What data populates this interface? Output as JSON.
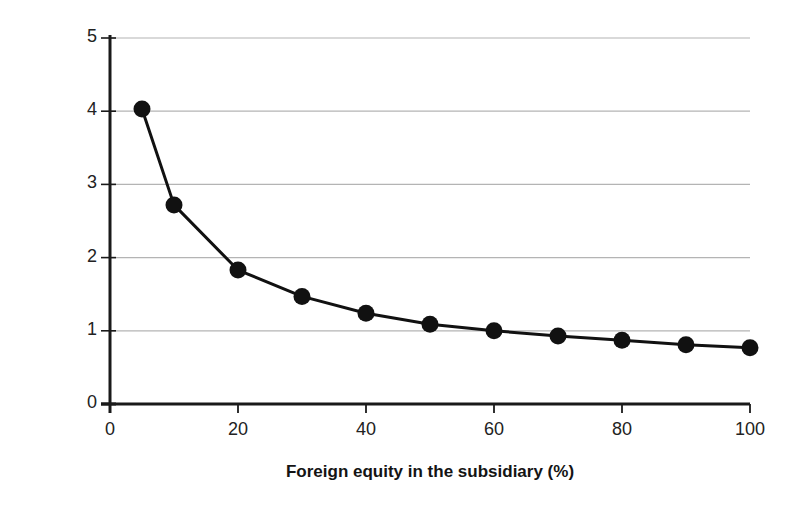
{
  "chart_data": {
    "type": "line",
    "title": "",
    "subtitle": "",
    "xlabel": "Foreign equity in the subsidiary (%)",
    "ylabel": "Mortality risk",
    "xlim": [
      0,
      100
    ],
    "ylim": [
      0,
      5
    ],
    "xticks": [
      0,
      20,
      40,
      60,
      80,
      100
    ],
    "yticks": [
      0,
      1,
      2,
      3,
      4,
      5
    ],
    "xtick_labels": [
      "0",
      "20",
      "40",
      "60",
      "80",
      "100"
    ],
    "ytick_labels": [
      "0",
      "1",
      "2",
      "3",
      "4",
      "5"
    ],
    "grid": "horizontal",
    "legend": "none",
    "marker": "filled-circle",
    "line_color": "#111111",
    "marker_color": "#111111",
    "grid_color": "#b4b4b4",
    "axis_color": "#1a1a1a",
    "series": [
      {
        "name": "Mortality risk",
        "x": [
          5,
          10,
          20,
          30,
          40,
          50,
          60,
          70,
          80,
          90,
          100
        ],
        "values": [
          4.03,
          2.72,
          1.83,
          1.47,
          1.24,
          1.09,
          1.0,
          0.93,
          0.87,
          0.81,
          0.77
        ]
      }
    ]
  },
  "axes": {
    "x_title": "Foreign equity in the subsidiary (%)",
    "y_title": "Mortality risk"
  }
}
